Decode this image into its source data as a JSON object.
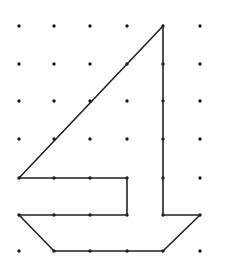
{
  "diagram": {
    "grid": {
      "cols": 6,
      "rows": 7,
      "x": [
        19,
        54,
        90,
        127,
        163,
        200
      ],
      "y": [
        26,
        64,
        101,
        139,
        178,
        215,
        251
      ],
      "dot_color": "#1a1a1a",
      "dot_radius": 1.7
    },
    "stroke_color": "#222222",
    "stroke_width": 1.6,
    "shapes": [
      {
        "name": "sail",
        "points": [
          [
            19,
            178
          ],
          [
            163,
            26
          ],
          [
            163,
            215
          ],
          [
            200,
            215
          ],
          [
            163,
            251
          ],
          [
            54,
            251
          ],
          [
            19,
            215
          ],
          [
            127,
            215
          ],
          [
            127,
            178
          ]
        ]
      }
    ],
    "sail_points": "19,178 163,26 163,215",
    "flag_box_points": "19,178 127,178 127,215 19,215",
    "hull_points": "19,215 163,215 200,215 163,251 54,251"
  }
}
